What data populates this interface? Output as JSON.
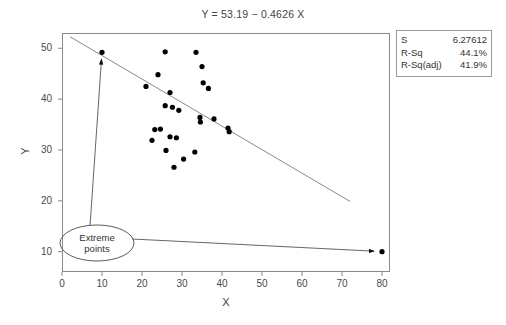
{
  "title": "Y = 53.19 − 0.4626 X",
  "axes": {
    "x_label": "X",
    "y_label": "Y",
    "x_ticks": [
      "0",
      "10",
      "20",
      "30",
      "40",
      "50",
      "60",
      "70",
      "80"
    ],
    "y_ticks": [
      "10",
      "20",
      "30",
      "40",
      "50"
    ]
  },
  "stats": {
    "rows": [
      {
        "key": "S",
        "value": "6.27612"
      },
      {
        "key": "R-Sq",
        "value": "44.1%"
      },
      {
        "key": "R-Sq(adj)",
        "value": "41.9%"
      }
    ]
  },
  "annotation": {
    "line1": "Extreme",
    "line2": "points"
  },
  "chart_data": {
    "type": "scatter",
    "title": "Y = 53.19 − 0.4626 X",
    "xlabel": "X",
    "ylabel": "Y",
    "xlim": [
      0,
      82
    ],
    "ylim": [
      6,
      53
    ],
    "grid": false,
    "legend": null,
    "marker_color": "#000000",
    "line_color": "#7a7a7a",
    "fit": {
      "intercept": 53.19,
      "slope": -0.4626,
      "s": 6.27612,
      "r_sq": 44.1,
      "r_sq_adj": 41.9,
      "x_start": 2.0,
      "x_end": 72.0
    },
    "points": [
      [
        10.0,
        49.2
      ],
      [
        24.0,
        44.8
      ],
      [
        25.8,
        49.3
      ],
      [
        33.5,
        49.2
      ],
      [
        35.0,
        46.4
      ],
      [
        35.3,
        43.2
      ],
      [
        36.6,
        42.1
      ],
      [
        21.0,
        42.5
      ],
      [
        27.0,
        41.3
      ],
      [
        25.8,
        38.7
      ],
      [
        27.6,
        38.4
      ],
      [
        29.2,
        37.8
      ],
      [
        23.2,
        34.0
      ],
      [
        24.6,
        34.1
      ],
      [
        22.5,
        31.9
      ],
      [
        27.0,
        32.6
      ],
      [
        28.6,
        32.4
      ],
      [
        34.5,
        36.4
      ],
      [
        34.6,
        35.5
      ],
      [
        38.0,
        36.1
      ],
      [
        41.5,
        34.3
      ],
      [
        41.8,
        33.6
      ],
      [
        26.0,
        29.9
      ],
      [
        30.4,
        28.2
      ],
      [
        33.2,
        29.6
      ],
      [
        28.0,
        26.6
      ],
      [
        80.0,
        10.0
      ]
    ],
    "annotations": [
      {
        "text": "Extreme points",
        "targets": [
          [
            10.0,
            49.2
          ],
          [
            80.0,
            10.0
          ]
        ]
      }
    ]
  }
}
